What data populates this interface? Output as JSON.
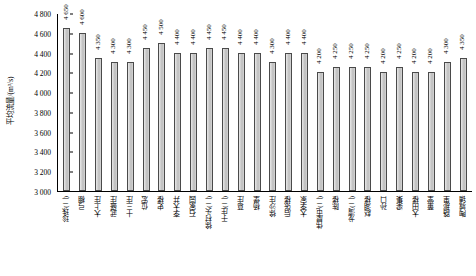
{
  "chart_data": {
    "type": "bar",
    "title": "",
    "xlabel": "",
    "ylabel": "平均流量/(m³/s)",
    "ylim": [
      3000,
      4800
    ],
    "ytick_step": 200,
    "yticks": [
      "4 800",
      "4 600",
      "4 400",
      "4 200",
      "4 000",
      "3 800",
      "3 600",
      "3 400",
      "3 200",
      "3 000"
    ],
    "grid": false,
    "legend": "none",
    "bar_color": "#cfcfcf",
    "bar_edge_color": "#4a4a4a",
    "categories": [
      "珍珠(二)",
      "弓棚",
      "大上庄",
      "武盛庄",
      "十三庄",
      "位宏",
      "史楼",
      "李大井",
      "石家园",
      "徐村头(二)",
      "于庄(二)",
      "葛庄",
      "杨堡",
      "徐沙庄",
      "后张楼",
      "大李家",
      "伟屋屯(二)",
      "陈楼",
      "龙湾(二)",
      "赵湖楼",
      "孙口",
      "梁集",
      "大田楼",
      "董堂",
      "路那里",
      "陶城铺"
    ],
    "values": [
      4650,
      4600,
      4350,
      4300,
      4300,
      4450,
      4500,
      4400,
      4400,
      4450,
      4450,
      4400,
      4400,
      4300,
      4400,
      4400,
      4200,
      4250,
      4250,
      4250,
      4200,
      4250,
      4200,
      4200,
      4300,
      4350
    ],
    "value_labels": [
      "4 650",
      "4 600",
      "4 350",
      "4 300",
      "4 300",
      "4 450",
      "4 500",
      "4 400",
      "4 400",
      "4 450",
      "4 450",
      "4 400",
      "4 400",
      "4 300",
      "4 400",
      "4 400",
      "4 200",
      "4 250",
      "4 250",
      "4 250",
      "4 200",
      "4 250",
      "4 200",
      "4 200",
      "4 300",
      "4 350"
    ]
  }
}
